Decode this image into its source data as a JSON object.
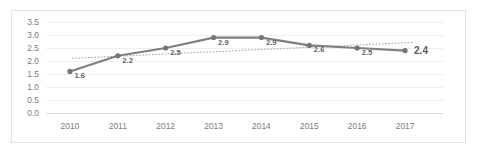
{
  "chart_data": {
    "type": "line",
    "title": "",
    "subtitle": "",
    "xlabel": "",
    "ylabel": "",
    "categories": [
      "2010",
      "2011",
      "2012",
      "2013",
      "2014",
      "2015",
      "2016",
      "2017"
    ],
    "values": [
      1.6,
      2.2,
      2.5,
      2.9,
      2.9,
      2.6,
      2.5,
      2.4
    ],
    "point_labels": [
      "1.6",
      "2.2",
      "2.5",
      "2.9",
      "2.9",
      "2.6",
      "2.5",
      "2.4"
    ],
    "ylim": [
      0.0,
      3.5
    ],
    "yticks": [
      "0.0",
      "0.5",
      "1.0",
      "1.5",
      "2.0",
      "2.5",
      "3.0",
      "3.5"
    ],
    "ytick_values": [
      0.0,
      0.5,
      1.0,
      1.5,
      2.0,
      2.5,
      3.0,
      3.5
    ],
    "grid": true,
    "grid_axis": "y",
    "legend": false,
    "legend_position": "none",
    "series": [
      {
        "name": "series-1",
        "type": "line",
        "values": [
          1.6,
          2.2,
          2.5,
          2.9,
          2.9,
          2.6,
          2.5,
          2.4
        ],
        "color": "#7f7f7f",
        "marker": "circle",
        "show_labels": true
      },
      {
        "name": "trendline",
        "type": "trendline",
        "style": "dotted",
        "color": "#a6a6a6",
        "start_value": 2.1,
        "end_value": 2.72,
        "show_labels": false
      }
    ],
    "colors": {
      "series": "#7f7f7f",
      "trendline": "#a6a6a6",
      "marker": "#757575",
      "gridline": "#eceff1",
      "axis": "#d9d9d9",
      "tick_text": "#7b7b7b",
      "label_text": "#5f5f5f",
      "border": "#e2e2e2",
      "background": "#ffffff"
    }
  }
}
